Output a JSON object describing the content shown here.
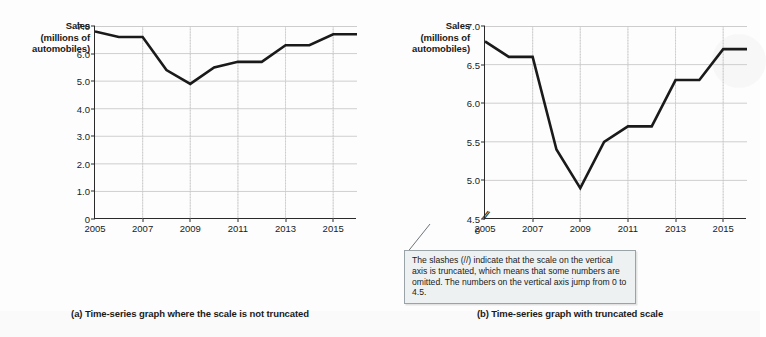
{
  "figure": {
    "background_color": "#fdfdfd",
    "line_color": "#1a1a1a",
    "grid_color": "#c9c9c9"
  },
  "panel_a": {
    "caption": "(a) Time-series graph where the scale is not truncated",
    "axis_label_lines": [
      "Sales",
      "(millions of",
      "automobiles)"
    ]
  },
  "panel_b": {
    "caption": "(b) Time-series graph with truncated scale",
    "axis_label_lines": [
      "Sales",
      "(millions of",
      "automobiles)"
    ],
    "axis_break_glyph": "//"
  },
  "callout": {
    "text": "The slashes (//) indicate that the scale on the vertical axis is truncated, which means that some numbers are omitted.  The numbers on the vertical axis jump from 0 to 4.5.",
    "background_color": "#eef1f2",
    "border_color": "#9aa3a8"
  },
  "chart_data": [
    {
      "type": "line",
      "title": "(a) Time-series graph where the scale is not truncated",
      "xlabel": "",
      "ylabel": "Sales (millions of automobiles)",
      "x": [
        2005,
        2006,
        2007,
        2008,
        2009,
        2010,
        2011,
        2012,
        2013,
        2014,
        2015,
        2016
      ],
      "values": [
        6.8,
        6.6,
        6.6,
        5.4,
        4.9,
        5.5,
        5.7,
        5.7,
        6.3,
        6.3,
        6.7,
        6.7
      ],
      "xlim": [
        2005,
        2016
      ],
      "ylim": [
        0,
        7.0
      ],
      "ytick_labels": [
        "7.0",
        "6.0",
        "5.0",
        "4.0",
        "3.0",
        "2.0",
        "1.0",
        "0"
      ],
      "ytick_values": [
        7.0,
        6.0,
        5.0,
        4.0,
        3.0,
        2.0,
        1.0,
        0
      ],
      "xtick_labels": [
        "2005",
        "2007",
        "2009",
        "2011",
        "2013",
        "2015"
      ],
      "xtick_values": [
        2005,
        2007,
        2009,
        2011,
        2013,
        2015
      ],
      "grid": true,
      "truncated_axis": false,
      "legend": null
    },
    {
      "type": "line",
      "title": "(b) Time-series graph with truncated scale",
      "xlabel": "",
      "ylabel": "Sales (millions of automobiles)",
      "x": [
        2005,
        2006,
        2007,
        2008,
        2009,
        2010,
        2011,
        2012,
        2013,
        2014,
        2015,
        2016
      ],
      "values": [
        6.8,
        6.6,
        6.6,
        5.4,
        4.9,
        5.5,
        5.7,
        5.7,
        6.3,
        6.3,
        6.7,
        6.7
      ],
      "xlim": [
        2005,
        2016
      ],
      "ylim": [
        4.5,
        7.0
      ],
      "ytick_labels": [
        "7.0",
        "6.5",
        "6.0",
        "5.5",
        "5.0",
        "4.5",
        "0"
      ],
      "ytick_values": [
        7.0,
        6.5,
        6.0,
        5.5,
        5.0,
        4.5,
        0
      ],
      "xtick_labels": [
        "2005",
        "2007",
        "2009",
        "2011",
        "2013",
        "2015"
      ],
      "xtick_values": [
        2005,
        2007,
        2009,
        2011,
        2013,
        2015
      ],
      "grid": true,
      "truncated_axis": true,
      "legend": null
    }
  ]
}
